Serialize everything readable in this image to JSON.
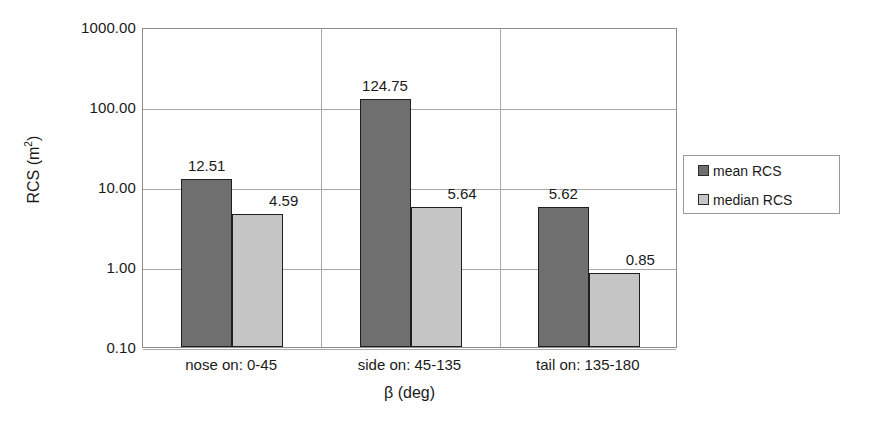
{
  "chart_data": {
    "type": "bar",
    "title": "",
    "subtitle": "",
    "xlabel": "β (deg)",
    "ylabel": "RCS (m²)",
    "ylabel_base": "RCS (m",
    "ylabel_exp": "2",
    "ylabel_tail": ")",
    "yscale": "log",
    "ylim": [
      0.1,
      1000.0
    ],
    "grid": "horizontal-and-category-separators",
    "legend_position": "right-outside",
    "categories": [
      "nose on:  0-45",
      "side on: 45-135",
      "tail on: 135-180"
    ],
    "yticks": [
      "0.10",
      "1.00",
      "10.00",
      "100.00",
      "1000.00"
    ],
    "ytick_values": [
      0.1,
      1.0,
      10.0,
      100.0,
      1000.0
    ],
    "series": [
      {
        "name": "mean RCS",
        "color": "#6f6f6f",
        "values": [
          12.51,
          124.75,
          5.62
        ],
        "labels": [
          "12.51",
          "124.75",
          "5.62"
        ]
      },
      {
        "name": "median RCS",
        "color": "#c5c5c5",
        "values": [
          4.59,
          5.64,
          0.85
        ],
        "labels": [
          "4.59",
          "5.64",
          "0.85"
        ]
      }
    ]
  },
  "legend": {
    "items": [
      {
        "label": "mean RCS",
        "swatch": "dark-gray-swatch"
      },
      {
        "label": "median RCS",
        "swatch": "light-gray-swatch"
      }
    ]
  },
  "colors": {
    "mean_bar": "#6f6f6f",
    "median_bar": "#c5c5c5",
    "bar_outline": "#1f1f1f",
    "gridline": "#a9a9a9",
    "axis": "#8c8c8c",
    "text": "#1a1a1a",
    "background": "#ffffff"
  }
}
